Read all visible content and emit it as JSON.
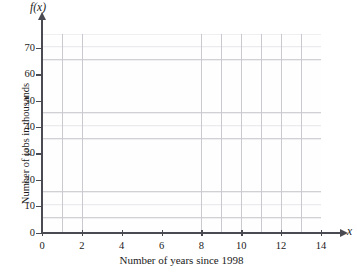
{
  "chart_data": {
    "type": "line",
    "title": "",
    "subtitle": "",
    "xlabel": "Number of years since 1998",
    "ylabel": "Number of jobs in thousands",
    "x_axis_variable": "x",
    "y_axis_function_label": "f(x)",
    "xlim": [
      0,
      14
    ],
    "ylim": [
      0,
      75
    ],
    "x_ticks": [
      0,
      2,
      4,
      6,
      8,
      10,
      12,
      14
    ],
    "x_tick_labels": [
      "0",
      "2",
      "4",
      "6",
      "8",
      "10",
      "12",
      "14"
    ],
    "y_ticks": [
      0,
      10,
      20,
      30,
      40,
      50,
      60,
      70
    ],
    "y_tick_labels": [
      "0",
      "10",
      "20",
      "30",
      "40",
      "50",
      "60",
      "70"
    ],
    "x_major_gridline_step": 1,
    "y_major_gridline_step": 10,
    "y_minor_gridline_step": 5,
    "grid": true,
    "legend": false,
    "legend_position": "none",
    "series": [],
    "values": [],
    "categories": [],
    "annotations": [],
    "colors": {
      "axis": "#4a4a52",
      "major_gridline": "#c9c9cf",
      "minor_gridline": "#e6e6ea",
      "plot_background": "#fefeff",
      "page_background": "#ffffff",
      "text": "#1a1a1a"
    }
  },
  "axes": {
    "y_title": "Number of jobs in thousands",
    "x_title": "Number of years since 1998",
    "y_function_label": "f(x)",
    "x_variable_label": "x"
  },
  "y_tick_items": [
    {
      "label": "70",
      "top": 43
    },
    {
      "label": "60",
      "top": 69.4
    },
    {
      "label": "50",
      "top": 95.7
    },
    {
      "label": "40",
      "top": 122.1
    },
    {
      "label": "30",
      "top": 148.4
    },
    {
      "label": "20",
      "top": 174.8
    },
    {
      "label": "10",
      "top": 201.1
    },
    {
      "label": "0",
      "top": 227.5
    }
  ],
  "x_tick_items": [
    {
      "label": "0",
      "left": 42
    },
    {
      "label": "2",
      "left": 81.9
    },
    {
      "label": "4",
      "left": 121.7
    },
    {
      "label": "6",
      "left": 161.6
    },
    {
      "label": "8",
      "left": 201.4
    },
    {
      "label": "10",
      "left": 241.3
    },
    {
      "label": "12",
      "left": 281.1
    },
    {
      "label": "14",
      "left": 321
    }
  ]
}
